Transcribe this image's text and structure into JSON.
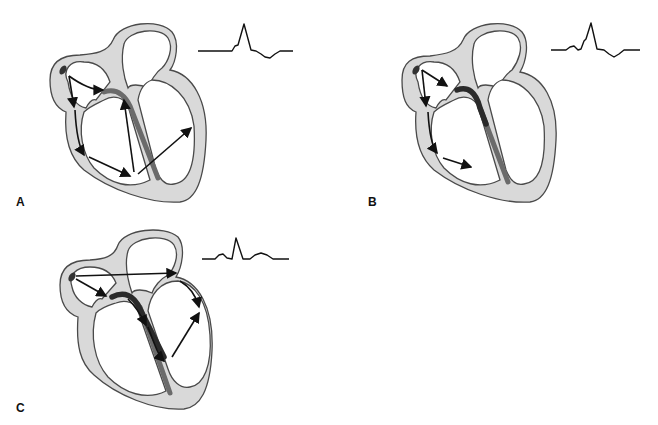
{
  "figure": {
    "panels": [
      {
        "label": "A",
        "ecg_pattern": "wide QRS with slurred upstroke (delta wave), no visible P wave, inverted T wave",
        "pathway": "sinus node impulse conducted through atrium and accessory pathway to ventricles; multiple arrows spreading across ventricular myocardium"
      },
      {
        "label": "B",
        "ecg_pattern": "P wave followed by short PR, delta wave, wide QRS, inverted T wave",
        "pathway": "sinus node impulse reaches AV node/His bundle and accessory pathway simultaneously; fusion activation"
      },
      {
        "label": "C",
        "ecg_pattern": "normal P wave, narrow QRS, upright T wave",
        "pathway": "sinus node impulse conducted via AV node and His-Purkinje system; long arrow across atria to left side"
      }
    ]
  },
  "labels": {
    "a": "A",
    "b": "B",
    "c": "C"
  },
  "colors": {
    "wall": "#d9d9d9",
    "outline": "#4a4a4a",
    "conduction": "#2a2a2a",
    "arrows": "#111111"
  }
}
